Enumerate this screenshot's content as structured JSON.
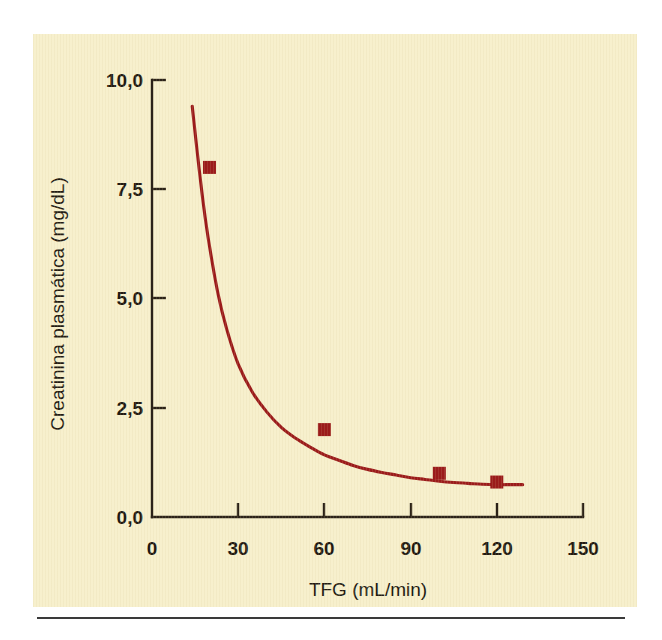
{
  "figure": {
    "panel_background": "#f7f0cd",
    "page_background": "#ffffff",
    "axis_color": "#2b2218",
    "accent_color": "#9b1b1b"
  },
  "chart_data": {
    "type": "scatter",
    "title": "",
    "xlabel": "TFG (mL/min)",
    "ylabel": "Creatinina plasmática (mg/dL)",
    "xlim": [
      0,
      150
    ],
    "ylim": [
      0.0,
      10.0
    ],
    "xticks": [
      0,
      30,
      60,
      90,
      120,
      150
    ],
    "yticks": [
      0.0,
      2.5,
      5.0,
      7.5,
      10.0
    ],
    "xticklabels": [
      "0",
      "30",
      "60",
      "90",
      "120",
      "150"
    ],
    "yticklabels": [
      "0,0",
      "2,5",
      "5,0",
      "7,5",
      "10,0"
    ],
    "grid": false,
    "legend": false,
    "decimal_separator": ",",
    "series": [
      {
        "name": "Pontos medidos",
        "type": "scatter",
        "marker": "square",
        "color": "#9b1b1b",
        "x": [
          20,
          60,
          100,
          120
        ],
        "y": [
          8.0,
          2.0,
          1.0,
          0.8
        ]
      },
      {
        "name": "Curva ajustada (hipérbole)",
        "type": "line",
        "color": "#9b1b1b",
        "x": [
          14,
          16,
          18,
          20,
          23,
          26,
          30,
          35,
          40,
          45,
          50,
          55,
          60,
          65,
          70,
          75,
          80,
          85,
          90,
          95,
          100,
          105,
          110,
          115,
          120,
          125,
          129
        ],
        "y": [
          9.4,
          8.2,
          7.1,
          6.2,
          5.1,
          4.3,
          3.5,
          2.85,
          2.4,
          2.05,
          1.8,
          1.6,
          1.42,
          1.3,
          1.18,
          1.09,
          1.02,
          0.96,
          0.9,
          0.86,
          0.82,
          0.79,
          0.77,
          0.75,
          0.74,
          0.74,
          0.74
        ]
      }
    ],
    "annotations": []
  },
  "axes": {
    "y": {
      "label": "Creatinina plasmática (mg/dL)",
      "ticks": [
        {
          "value": "10,0"
        },
        {
          "value": "7,5"
        },
        {
          "value": "5,0"
        },
        {
          "value": "2,5"
        },
        {
          "value": "0,0"
        }
      ]
    },
    "x": {
      "label": "TFG (mL/min)",
      "ticks": [
        {
          "value": "0"
        },
        {
          "value": "30"
        },
        {
          "value": "60"
        },
        {
          "value": "90"
        },
        {
          "value": "120"
        },
        {
          "value": "150"
        }
      ]
    }
  }
}
